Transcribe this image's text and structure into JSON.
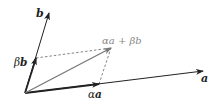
{
  "diagram": {
    "colors": {
      "vector": "#222222",
      "result": "#777777",
      "dashed": "#666666",
      "result_label": "#888888"
    },
    "origin": [
      25,
      93
    ],
    "vectors": {
      "a": {
        "label": "a",
        "tip": [
          203,
          71
        ]
      },
      "b": {
        "label": "b",
        "tip": [
          49,
          13
        ]
      },
      "alpha_a": {
        "label": "αa",
        "tip": [
          99,
          84
        ]
      },
      "beta_b": {
        "label": "βb",
        "tip": [
          36,
          58
        ]
      },
      "sum": {
        "label": "αa + βb",
        "tip": [
          111,
          48
        ]
      }
    },
    "labels": {
      "a": "a",
      "b": "b",
      "alpha_a_alpha": "α",
      "alpha_a_a": "a",
      "beta_b_beta": "β",
      "beta_b_b": "b",
      "sum_text": "αa + βb"
    }
  }
}
